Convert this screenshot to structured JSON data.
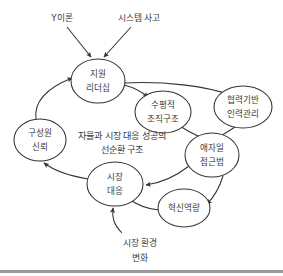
{
  "diagram": {
    "type": "causal-loop-diagram",
    "language": "ko",
    "caption": {
      "line1": "자율과 시장 대응 성공의",
      "line2": "선순환 구조"
    },
    "colors": {
      "stroke": "#333333",
      "text": "#3a3a3a",
      "node_fill": "#ffffff",
      "background": "#ffffff",
      "footer_rule": "#9a9a9a"
    },
    "nodes": [
      {
        "id": "supportive-leadership",
        "line1": "지원",
        "line2": "리더십",
        "cx": 98,
        "cy": 81,
        "rx": 27,
        "ry": 22
      },
      {
        "id": "horizontal-structure",
        "line1": "수평적",
        "line2": "조직구조",
        "cx": 163,
        "cy": 112,
        "rx": 28,
        "ry": 21
      },
      {
        "id": "collaborative-hr",
        "line1": "협력기반",
        "line2": "인력관리",
        "cx": 243,
        "cy": 107,
        "rx": 29,
        "ry": 21
      },
      {
        "id": "member-trust",
        "line1": "구성원",
        "line2": "신뢰",
        "cx": 40,
        "cy": 140,
        "rx": 26,
        "ry": 21
      },
      {
        "id": "agile-approach",
        "line1": "애자일",
        "line2": "접근법",
        "cx": 212,
        "cy": 155,
        "rx": 27,
        "ry": 22
      },
      {
        "id": "market-response",
        "line1": "시장",
        "line2": "대응",
        "cx": 115,
        "cy": 184,
        "rx": 28,
        "ry": 22
      },
      {
        "id": "innovation-capability",
        "line1": "혁신역량",
        "line2": "",
        "cx": 184,
        "cy": 208,
        "rx": 26,
        "ry": 19
      }
    ],
    "external_labels": [
      {
        "id": "theory-y",
        "text": "Y이론",
        "x": 62,
        "y": 18
      },
      {
        "id": "systems-thinking",
        "text": "시스템 사고",
        "x": 139,
        "y": 18
      },
      {
        "id": "market-environment-change-line1",
        "text": "시장 환경",
        "x": 140,
        "y": 243
      },
      {
        "id": "market-environment-change-line2",
        "text": "변화",
        "x": 140,
        "y": 258
      }
    ],
    "edges": [
      {
        "id": "theory-y-to-leadership",
        "from": "theory-y",
        "to": "supportive-leadership"
      },
      {
        "id": "systems-thinking-to-leadership",
        "from": "systems-thinking",
        "to": "supportive-leadership"
      },
      {
        "id": "leadership-to-horizontal-structure",
        "from": "supportive-leadership",
        "to": "horizontal-structure"
      },
      {
        "id": "leadership-to-collaborative-hr",
        "from": "supportive-leadership",
        "to": "collaborative-hr"
      },
      {
        "id": "horizontal-structure-to-agile",
        "from": "horizontal-structure",
        "to": "agile-approach"
      },
      {
        "id": "collaborative-hr-to-agile",
        "from": "collaborative-hr",
        "to": "agile-approach"
      },
      {
        "id": "agile-to-market-response",
        "from": "agile-approach",
        "to": "market-response"
      },
      {
        "id": "agile-to-innovation",
        "from": "agile-approach",
        "to": "innovation-capability"
      },
      {
        "id": "innovation-to-market-response",
        "from": "innovation-capability",
        "to": "market-response"
      },
      {
        "id": "market-response-to-member-trust",
        "from": "market-response",
        "to": "member-trust"
      },
      {
        "id": "member-trust-to-leadership",
        "from": "member-trust",
        "to": "supportive-leadership"
      },
      {
        "id": "market-environment-change-to-market-response",
        "from": "market-environment-change",
        "to": "market-response"
      }
    ]
  }
}
